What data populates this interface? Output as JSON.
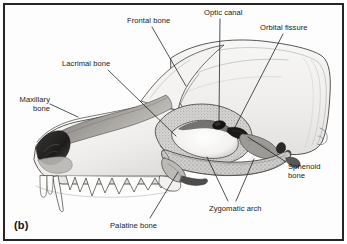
{
  "figure": {
    "tag": "(b)",
    "border_color": "#262626",
    "background_color": "#fdfdfd",
    "ink_color": "#1a1a1a"
  },
  "labels": [
    {
      "id": "frontal-bone",
      "text": "Frontal bone",
      "lines": [
        "Frontal bone"
      ],
      "x": 127,
      "y": 17,
      "align": "left"
    },
    {
      "id": "optic-canal",
      "text": "Optic canal",
      "lines": [
        "Optic canal"
      ],
      "x": 204,
      "y": 9,
      "align": "left"
    },
    {
      "id": "orbital-fissure",
      "text": "Orbital fissure",
      "lines": [
        "Orbital fissure"
      ],
      "x": 260,
      "y": 24,
      "align": "left"
    },
    {
      "id": "lacrimal-bone",
      "text": "Lacrimal bone",
      "lines": [
        "Lacrimal bone"
      ],
      "x": 62,
      "y": 60,
      "align": "left"
    },
    {
      "id": "maxillary-bone",
      "text": "Maxillary bone",
      "lines": [
        "Maxillary",
        "bone"
      ],
      "x": 14,
      "y": 96,
      "align": "right"
    },
    {
      "id": "sphenoid-bone",
      "text": "Sphenoid bone",
      "lines": [
        "Sphenoid",
        "bone"
      ],
      "x": 288,
      "y": 163,
      "align": "left"
    },
    {
      "id": "zygomatic-arch",
      "text": "Zygomatic arch",
      "lines": [
        "Zygomatic arch"
      ],
      "x": 209,
      "y": 205,
      "align": "left"
    },
    {
      "id": "palatine-bone",
      "text": "Palatine bone",
      "lines": [
        "Palatine bone"
      ],
      "x": 110,
      "y": 222,
      "align": "left"
    }
  ],
  "leader_lines": [
    {
      "id": "leader-frontal-bone",
      "points": "152,27 186,86"
    },
    {
      "id": "leader-optic-canal",
      "points": "220,19 219,124"
    },
    {
      "id": "leader-orbital-fissure",
      "points": "283,34 232,128"
    },
    {
      "id": "leader-lacrimal-bone",
      "points": "108,70 176,136"
    },
    {
      "id": "leader-maxillary-bone",
      "points": "50,104 76,116"
    },
    {
      "id": "leader-sphenoid-bone",
      "points": "286,168 243,136"
    },
    {
      "id": "leader-zygomatic-a",
      "points": "228,202 206,156"
    },
    {
      "id": "leader-zygomatic-b",
      "points": "237,202 253,158"
    },
    {
      "id": "leader-palatine-bone",
      "points": "150,219 178,172"
    }
  ]
}
